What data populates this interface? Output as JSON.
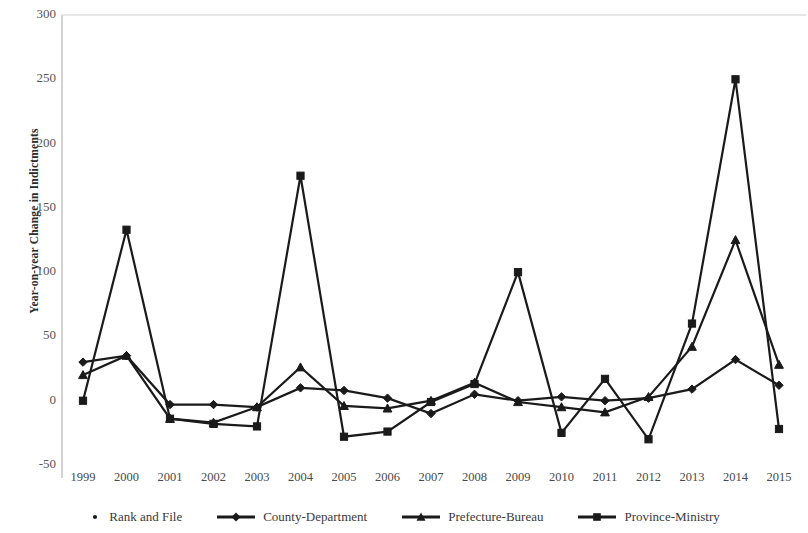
{
  "chart_data": {
    "type": "line",
    "title": "",
    "xlabel": "",
    "ylabel": "Year-on-year Change in Indictments",
    "categories": [
      "1999",
      "2000",
      "2001",
      "2002",
      "2003",
      "2004",
      "2005",
      "2006",
      "2007",
      "2008",
      "2009",
      "2010",
      "2011",
      "2012",
      "2013",
      "2014",
      "2015"
    ],
    "ylim": [
      -50,
      300
    ],
    "ytick_values": [
      -50,
      0,
      50,
      100,
      150,
      200,
      250,
      300
    ],
    "ytick_labels": [
      "-50",
      "0",
      "50",
      "100",
      "150",
      "200",
      "250",
      "300"
    ],
    "grid": false,
    "legend_position": "bottom",
    "series": [
      {
        "name": "Rank and File",
        "marker": "dot",
        "line": false,
        "values": [
          0,
          null,
          null,
          null,
          null,
          null,
          null,
          null,
          null,
          null,
          null,
          null,
          null,
          null,
          null,
          null,
          null
        ]
      },
      {
        "name": "County-Department",
        "marker": "diamond",
        "line": true,
        "values": [
          30,
          35,
          -3,
          -3,
          -5,
          10,
          8,
          2,
          -10,
          5,
          0,
          3,
          0,
          2,
          9,
          32,
          12
        ]
      },
      {
        "name": "Prefecture-Bureau",
        "marker": "triangle",
        "line": true,
        "values": [
          20,
          35,
          -14,
          -17,
          -5,
          26,
          -4,
          -6,
          0,
          14,
          -1,
          -5,
          -9,
          3,
          42,
          125,
          28
        ]
      },
      {
        "name": "Province-Ministry",
        "marker": "square",
        "line": true,
        "values": [
          0,
          133,
          -14,
          -18,
          -20,
          175,
          -28,
          -24,
          -1,
          13,
          100,
          -25,
          17,
          -30,
          60,
          250,
          -22
        ]
      }
    ]
  },
  "axis": {
    "y_label_text": "Year-on-year Change in Indictments"
  }
}
